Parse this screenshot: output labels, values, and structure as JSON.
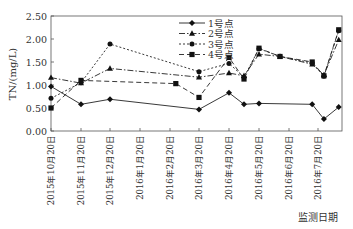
{
  "chart_data": {
    "type": "line",
    "title": "",
    "xlabel": "监测日期",
    "ylabel": "TN/(mg/L)",
    "ylim": [
      0,
      2.5
    ],
    "yticks": [
      "0.00",
      "0.50",
      "1.00",
      "1.50",
      "2.00",
      "2.50"
    ],
    "grid": false,
    "legend_position": "top-center",
    "categories": [
      "2015年10月20日",
      "2015年11月20日",
      "2015年12月20日",
      "2016年1月20日",
      "2016年2月20日",
      "2016年3月20日",
      "2016年4月20日",
      "2016年5月20日",
      "2016年6月20日",
      "2016年7月20日"
    ],
    "series": [
      {
        "name": "1号点",
        "marker": "diamond",
        "style": "solid",
        "points": [
          [
            0,
            0.97
          ],
          [
            1,
            0.58
          ],
          [
            2,
            0.69
          ],
          [
            5,
            0.47
          ],
          [
            6,
            0.83
          ],
          [
            6.5,
            0.58
          ],
          [
            7,
            0.6
          ],
          [
            8.8,
            0.58
          ],
          [
            9.2,
            0.26
          ],
          [
            9.7,
            0.52
          ]
        ]
      },
      {
        "name": "2号点",
        "marker": "triangle",
        "style": "dash-dot",
        "points": [
          [
            0,
            1.16
          ],
          [
            1,
            1.04
          ],
          [
            2,
            1.36
          ],
          [
            5,
            1.17
          ],
          [
            6,
            1.26
          ],
          [
            6.5,
            1.2
          ],
          [
            7,
            1.67
          ],
          [
            7.7,
            1.62
          ],
          [
            8.8,
            1.45
          ],
          [
            9.2,
            1.22
          ],
          [
            9.7,
            1.98
          ]
        ]
      },
      {
        "name": "3号点",
        "marker": "circle",
        "style": "dotted",
        "points": [
          [
            0,
            0.71
          ],
          [
            1,
            1.05
          ],
          [
            2,
            1.89
          ],
          [
            5,
            1.29
          ],
          [
            6,
            1.47
          ],
          [
            6.5,
            1.17
          ],
          [
            7,
            1.79
          ],
          [
            7.7,
            1.62
          ],
          [
            8.8,
            1.48
          ],
          [
            9.2,
            1.19
          ],
          [
            9.7,
            2.18
          ]
        ]
      },
      {
        "name": "4号点",
        "marker": "square",
        "style": "dashed",
        "points": [
          [
            0,
            0.5
          ],
          [
            1,
            1.1
          ],
          [
            4.2,
            1.03
          ],
          [
            5,
            0.73
          ],
          [
            6,
            1.6
          ],
          [
            6.5,
            1.13
          ],
          [
            7,
            1.8
          ],
          [
            7.7,
            1.62
          ],
          [
            8.8,
            1.5
          ],
          [
            9.2,
            1.2
          ],
          [
            9.7,
            2.2
          ]
        ]
      }
    ]
  }
}
